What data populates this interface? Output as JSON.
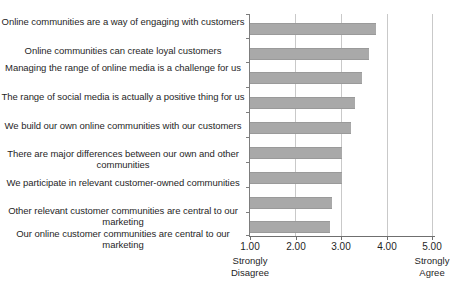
{
  "chart_data": {
    "type": "bar",
    "orientation": "horizontal",
    "title": "",
    "xlabel": "",
    "ylabel": "",
    "xlim": [
      1.0,
      5.0
    ],
    "grid": true,
    "legend": false,
    "xticks": [
      "1.00",
      "2.00",
      "3.00",
      "4.00",
      "5.00"
    ],
    "xtick_values": [
      1.0,
      2.0,
      3.0,
      4.0,
      5.0
    ],
    "scale_anchors": {
      "low": "Strongly Disagree",
      "low_line1": "Strongly",
      "low_line2": "Disagree",
      "high": "Strongly Agree",
      "high_line1": "Strongly",
      "high_line2": "Agree"
    },
    "bar_color": "#a9a9a9",
    "categories": [
      "Online communities are a way of engaging with customers",
      "Online communities can create loyal customers",
      "Managing the range of online media is a challenge for us",
      "The range of social media is actually a positive thing for us",
      "We build our own online communities with our customers",
      "There are major differences between our own and other communities",
      "We participate in relevant customer-owned communities",
      "Other relevant customer communities are central to our marketing",
      "Our online customer communities are central to our marketing"
    ],
    "values": [
      3.75,
      3.6,
      3.45,
      3.3,
      3.2,
      3.0,
      3.0,
      2.8,
      2.75
    ]
  }
}
